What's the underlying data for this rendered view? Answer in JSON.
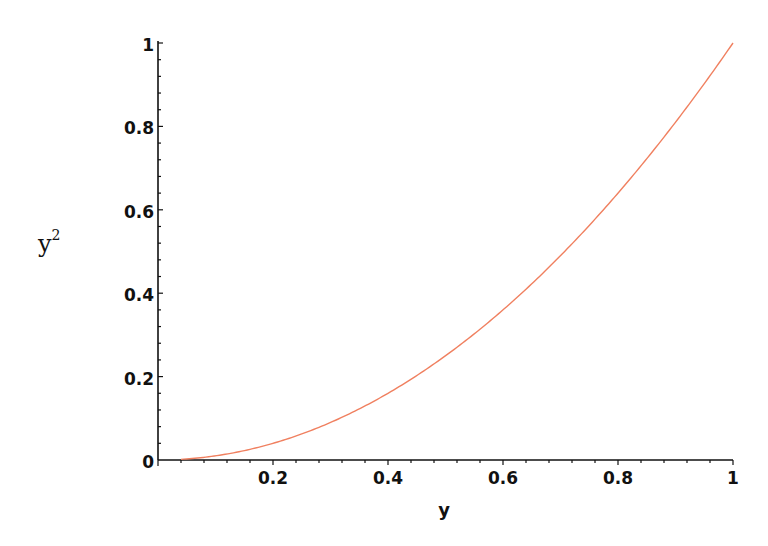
{
  "chart_data": {
    "type": "line",
    "title": "",
    "xlabel": "y",
    "ylabel": "y^2",
    "ylabel_base": "y",
    "ylabel_sup": "2",
    "xlim": [
      0,
      1
    ],
    "ylim": [
      0,
      1
    ],
    "grid": false,
    "legend": null,
    "x_ticks": [
      "0.2",
      "0.4",
      "0.6",
      "0.8",
      "1"
    ],
    "x_tick_values": [
      0.2,
      0.4,
      0.6,
      0.8,
      1.0
    ],
    "y_ticks": [
      "0",
      "0.2",
      "0.4",
      "0.6",
      "0.8",
      "1"
    ],
    "y_tick_values": [
      0,
      0.2,
      0.4,
      0.6,
      0.8,
      1.0
    ],
    "series": [
      {
        "name": "y^2",
        "color": "#f08060",
        "function": "y^2",
        "x": [
          0,
          0.1,
          0.2,
          0.3,
          0.4,
          0.5,
          0.6,
          0.7,
          0.8,
          0.9,
          1.0
        ],
        "values": [
          0,
          0.01,
          0.04,
          0.09,
          0.16,
          0.25,
          0.36,
          0.49,
          0.64,
          0.81,
          1.0
        ]
      }
    ]
  },
  "colors": {
    "axis": "#111111",
    "curve": "#f08060",
    "background": "#ffffff"
  }
}
